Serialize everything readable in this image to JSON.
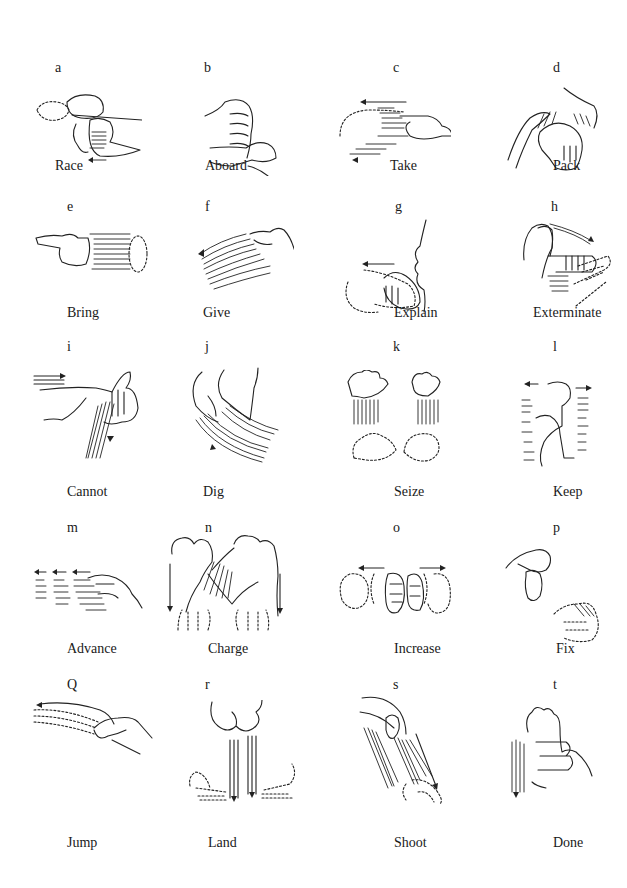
{
  "figure": {
    "rows": [
      [
        {
          "letter": "a",
          "label": "Race"
        },
        {
          "letter": "b",
          "label": "Aboard"
        },
        {
          "letter": "c",
          "label": "Take"
        },
        {
          "letter": "d",
          "label": "Pack"
        }
      ],
      [
        {
          "letter": "e",
          "label": "Bring"
        },
        {
          "letter": "f",
          "label": "Give"
        },
        {
          "letter": "g",
          "label": "Explain"
        },
        {
          "letter": "h",
          "label": "Exterminate"
        }
      ],
      [
        {
          "letter": "i",
          "label": "Cannot"
        },
        {
          "letter": "j",
          "label": "Dig"
        },
        {
          "letter": "k",
          "label": "Seize"
        },
        {
          "letter": "l",
          "label": "Keep"
        }
      ],
      [
        {
          "letter": "m",
          "label": "Advance"
        },
        {
          "letter": "n",
          "label": "Charge"
        },
        {
          "letter": "o",
          "label": "Increase"
        },
        {
          "letter": "p",
          "label": "Fix"
        }
      ],
      [
        {
          "letter": "Q",
          "label": "Jump"
        },
        {
          "letter": "r",
          "label": "Land"
        },
        {
          "letter": "s",
          "label": "Shoot"
        },
        {
          "letter": "t",
          "label": "Done"
        }
      ]
    ]
  }
}
